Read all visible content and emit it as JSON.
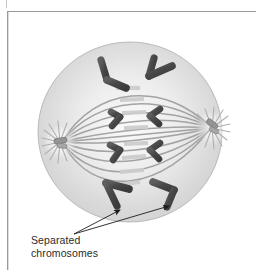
{
  "figure": {
    "title_alt": "Anaphase of mitosis",
    "caption": "Separated\nchromosomes",
    "caption_line1": "Separated",
    "caption_line2": "chromosomes",
    "background_color": "#ffffff",
    "frame_color": "#9a9a9a"
  },
  "cell": {
    "label": "dividing cell",
    "fill_color": "#d4d4d4",
    "fill_color_inner": "#f2f2f2",
    "outline_color": "#b0b0b0",
    "center_x": 130,
    "center_y": 132,
    "radius_x": 92,
    "radius_y": 90
  },
  "centrosomes": [
    {
      "name": "left-centrosome",
      "x": 60,
      "y": 142,
      "aster_color": "#b9b9b9",
      "centriole_color": "#8a8a8a"
    },
    {
      "name": "right-centrosome",
      "x": 212,
      "y": 128,
      "aster_color": "#b9b9b9",
      "centriole_color": "#8a8a8a"
    }
  ],
  "spindle": {
    "fiber_color": "#a8a8a8",
    "overlap_color": "#cfcfcf",
    "fiber_count": 10
  },
  "chromosomes": {
    "color": "#4a4a4a",
    "highlight_color": "#6e6e6e",
    "count": 8,
    "groups": [
      {
        "name": "upper-left-pair",
        "note": "V-shaped chromatid moving toward top"
      },
      {
        "name": "upper-right-pair",
        "note": "V-shaped chromatid moving toward top"
      },
      {
        "name": "mid-upper-left",
        "note": "small V pointing right"
      },
      {
        "name": "mid-upper-right",
        "note": "small V pointing left"
      },
      {
        "name": "mid-lower-left",
        "note": "small V pointing right"
      },
      {
        "name": "mid-lower-right",
        "note": "small V pointing left"
      },
      {
        "name": "lower-left-pair",
        "note": "V-shaped chromatid moving toward bottom"
      },
      {
        "name": "lower-right-pair",
        "note": "V-shaped chromatid moving toward bottom"
      }
    ]
  },
  "annotation": {
    "arrow_color": "#1c1c1c",
    "origin_x": 74,
    "origin_y": 234,
    "targets": [
      {
        "x": 122,
        "y": 209
      },
      {
        "x": 171,
        "y": 205
      }
    ]
  }
}
